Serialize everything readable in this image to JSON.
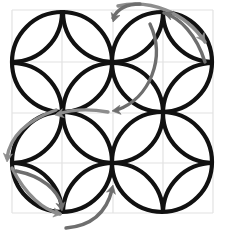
{
  "figure": {
    "type": "geometric-diagram",
    "canvas": {
      "width": 227,
      "height": 239,
      "background": "#ffffff"
    },
    "colors": {
      "stroke": "#111111",
      "arrow": "#6e6e6e",
      "arrow_light": "#8d8d8d",
      "grid": "#e2e2e2"
    },
    "stroke_width": 4.2,
    "arrow_width": 3.4,
    "grid": {
      "visible": true,
      "x_lines": [
        12,
        62,
        113,
        163,
        213
      ],
      "y_lines": [
        10,
        62,
        113,
        163,
        213
      ]
    },
    "circles": [
      {
        "name": "circle-top-left",
        "cx": 62,
        "cy": 62,
        "r": 50
      },
      {
        "name": "circle-top-right",
        "cx": 162,
        "cy": 62,
        "r": 50
      },
      {
        "name": "circle-bottom-left",
        "cx": 62,
        "cy": 162,
        "r": 50
      },
      {
        "name": "circle-bottom-right",
        "cx": 162,
        "cy": 162,
        "r": 50
      }
    ],
    "petal_radius": 50,
    "petal_centers": [
      {
        "name": "petal-hub-r0c0",
        "cx": 12,
        "cy": 12
      },
      {
        "name": "petal-hub-r0c1",
        "cx": 113,
        "cy": 12
      },
      {
        "name": "petal-hub-r0c2",
        "cx": 213,
        "cy": 12
      },
      {
        "name": "petal-hub-r1c0",
        "cx": 12,
        "cy": 113
      },
      {
        "name": "petal-hub-r1c1",
        "cx": 113,
        "cy": 113
      },
      {
        "name": "petal-hub-r1c2",
        "cx": 213,
        "cy": 113
      },
      {
        "name": "petal-hub-r2c0",
        "cx": 12,
        "cy": 213
      },
      {
        "name": "petal-hub-r2c1",
        "cx": 113,
        "cy": 213
      },
      {
        "name": "petal-hub-r2c2",
        "cx": 213,
        "cy": 213
      }
    ],
    "arrows": [
      {
        "name": "arrow-top-sweep-right",
        "path": "M 118 6 C 150 -1 185 12 205 42",
        "head": {
          "x": 205,
          "y": 42,
          "angle": 57
        },
        "shade": "light"
      },
      {
        "name": "arrow-top-right-to-apex",
        "path": "M 205 62 C 196 34 180 18 164 13",
        "head": {
          "x": 164,
          "y": 13,
          "angle": -162
        },
        "shade": "dark"
      },
      {
        "name": "arrow-top-center-down",
        "path": "M 140 4 C 128 4 118 8 113 18",
        "head": {
          "x": 113,
          "y": 22,
          "angle": 108
        },
        "shade": "dark"
      },
      {
        "name": "arrow-center-sweep-left",
        "path": "M 150 24 C 166 58 150 98 117 110",
        "head": {
          "x": 112,
          "y": 111,
          "angle": 172
        },
        "shade": "dark"
      },
      {
        "name": "arrow-mid-left-hook",
        "path": "M 108 112 C 86 108 70 110 58 114",
        "head": {
          "x": 55,
          "y": 115,
          "angle": 168
        },
        "shade": "light"
      },
      {
        "name": "arrow-left-sweep-down",
        "path": "M 56 110 C 28 120 10 136 7 158",
        "head": {
          "x": 7,
          "y": 162,
          "angle": 96
        },
        "shade": "light"
      },
      {
        "name": "arrow-lower-left-sweep",
        "path": "M 12 168 C 26 196 44 210 60 214",
        "head": {
          "x": 62,
          "y": 214,
          "angle": 10
        },
        "shade": "light"
      },
      {
        "name": "arrow-bottom-left-down",
        "path": "M 16 171 C 42 176 58 190 62 206",
        "head": {
          "x": 62,
          "y": 211,
          "angle": 80
        },
        "shade": "dark"
      },
      {
        "name": "arrow-bottom-center-up",
        "path": "M 66 228 C 90 226 106 214 112 190",
        "head": {
          "x": 113,
          "y": 185,
          "angle": -76
        },
        "shade": "dark"
      }
    ]
  }
}
